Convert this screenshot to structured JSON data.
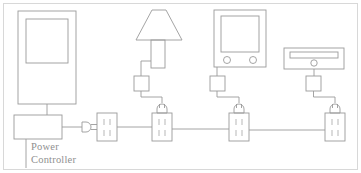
{
  "diagram": {
    "type": "schematic-line-drawing",
    "background_color": "#ffffff",
    "line_color": "#9a9a9a",
    "frame_color": "#d8d8d8",
    "text_color": "#8f8f8f",
    "labels": [
      {
        "id": "power-controller",
        "line1": "Power",
        "line2": "Controller"
      }
    ],
    "nodes": [
      {
        "id": "cabinet-panel",
        "name": "tall-panel-appliance",
        "shape": "rectangle-with-inner-rectangle",
        "x": 18,
        "y": 11,
        "w": 58,
        "h": 93
      },
      {
        "id": "power-controller-box",
        "name": "power-controller-unit",
        "shape": "rectangle",
        "x": 14,
        "y": 115,
        "w": 48,
        "h": 24
      },
      {
        "id": "lamp",
        "name": "table-lamp",
        "shape": "trapezoid-shade-with-stem",
        "x": 134,
        "y": 10,
        "w": 48,
        "h": 58
      },
      {
        "id": "television",
        "name": "television-set",
        "shape": "rectangle-screen-two-knobs",
        "x": 214,
        "y": 10,
        "w": 52,
        "h": 57
      },
      {
        "id": "disc-player",
        "name": "disc-player-unit",
        "shape": "wide-rectangle-with-slot",
        "x": 284,
        "y": 48,
        "w": 60,
        "h": 21
      }
    ],
    "adapters": [
      {
        "id": "adapter-lamp",
        "name": "power-adapter-brick",
        "x": 134,
        "y": 76,
        "w": 15,
        "h": 15
      },
      {
        "id": "adapter-tv",
        "name": "power-adapter-brick",
        "x": 210,
        "y": 76,
        "w": 15,
        "h": 15
      },
      {
        "id": "adapter-player",
        "name": "power-adapter-brick",
        "x": 306,
        "y": 76,
        "w": 15,
        "h": 15
      }
    ],
    "plugs": [
      {
        "id": "plug-controller",
        "name": "wall-plug-horizontal",
        "orientation": "horizontal",
        "x": 82,
        "y": 126
      },
      {
        "id": "plug-lamp",
        "name": "wall-plug-vertical",
        "orientation": "vertical",
        "x": 159,
        "y": 103
      },
      {
        "id": "plug-tv",
        "name": "wall-plug-vertical",
        "orientation": "vertical",
        "x": 236,
        "y": 103
      },
      {
        "id": "plug-player",
        "name": "wall-plug-vertical",
        "orientation": "vertical",
        "x": 332,
        "y": 103
      }
    ],
    "outlets": [
      {
        "id": "outlet-1",
        "name": "electrical-outlet",
        "slots": 2,
        "x": 97,
        "y": 113,
        "w": 20,
        "h": 28
      },
      {
        "id": "outlet-2",
        "name": "electrical-outlet",
        "slots": 2,
        "x": 152,
        "y": 113,
        "w": 20,
        "h": 28
      },
      {
        "id": "outlet-3",
        "name": "electrical-outlet",
        "slots": 2,
        "x": 229,
        "y": 113,
        "w": 20,
        "h": 28
      },
      {
        "id": "outlet-4",
        "name": "electrical-outlet",
        "slots": 2,
        "x": 325,
        "y": 113,
        "w": 20,
        "h": 28
      }
    ],
    "bus_line": {
      "name": "power-bus-wire",
      "y": 127,
      "x_start": 117,
      "x_end": 325
    }
  }
}
